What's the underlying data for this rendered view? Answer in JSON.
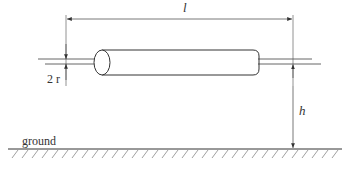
{
  "diagram": {
    "labels": {
      "length": "l",
      "diameter": "2 r",
      "height": "h",
      "ground": "ground"
    },
    "caption": {
      "text": "",
      "legible": false,
      "note": "Caption line is cropped at the bottom edge; only glyph tops are visible and the text cannot be read."
    },
    "colors": {
      "line": "#333333",
      "dimension": "#555555",
      "hatch": "#888888",
      "background": "#ffffff"
    }
  }
}
